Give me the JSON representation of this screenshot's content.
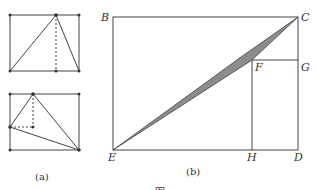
{
  "figure_a": {
    "caption": "(a)",
    "top": {
      "rect": {
        "x1": 10,
        "y1": 15,
        "x2": 79,
        "y2": 71
      },
      "apex": {
        "x": 56,
        "y": 15
      },
      "dashed_foot": {
        "x": 56,
        "y": 71
      }
    },
    "bottom": {
      "rect": {
        "x1": 10,
        "y1": 94,
        "x2": 79,
        "y2": 150
      },
      "apex": {
        "x": 33,
        "y": 94
      },
      "left_point": {
        "x": 10,
        "y": 127
      },
      "corner": {
        "x": 33,
        "y": 127
      },
      "right_point": {
        "x": 79,
        "y": 150
      }
    }
  },
  "figure_b": {
    "caption": "(b)",
    "points": {
      "B": {
        "label": "B",
        "x": 113,
        "y": 17
      },
      "C": {
        "label": "C",
        "x": 298,
        "y": 17
      },
      "D": {
        "label": "D",
        "x": 298,
        "y": 150
      },
      "E": {
        "label": "E",
        "x": 113,
        "y": 150
      },
      "F": {
        "label": "F",
        "x": 252,
        "y": 60
      },
      "G": {
        "label": "G",
        "x": 298,
        "y": 60
      },
      "H": {
        "label": "H",
        "x": 252,
        "y": 150
      }
    },
    "shade_color": "#8c8c8c"
  },
  "bottom_caption": "图"
}
